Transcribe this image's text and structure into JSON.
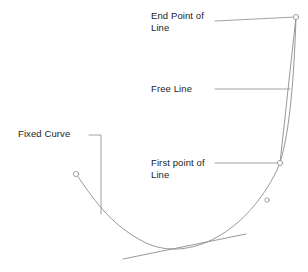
{
  "diagram": {
    "background_color": "#ffffff",
    "stroke_color": "#8c8c8c",
    "text_color": "#1d1d1d",
    "labels": {
      "end_point": "End Point of\nLine",
      "free_line": "Free Line",
      "first_point": "First point of\nLine",
      "fixed_curve": "Fixed Curve"
    },
    "geometry": {
      "fixed_curve": "M 76 174 C 92 196 108 224 146 243 C 190 263 247 232 277 170 C 289 144 294 80 296 17",
      "free_line": "M 280 163 L 296 17",
      "tangent_line": "M 123 259 L 246 234",
      "leader_end_point": "M 215 21 L 296 17",
      "leader_free_line": "M 215 89 L 290 89",
      "leader_first_point": "M 215 163 L 280 163",
      "leader_fixed_curve": "M 89 135 L 101 135 L 101 214"
    },
    "markers": [
      {
        "name": "curve-start-point",
        "cx": 76,
        "cy": 174,
        "r": 2.6
      },
      {
        "name": "line-first-point",
        "cx": 280,
        "cy": 163,
        "r": 2.6
      },
      {
        "name": "line-end-point",
        "cx": 296,
        "cy": 17,
        "r": 2.6
      },
      {
        "name": "curve-mid-point",
        "cx": 267,
        "cy": 200,
        "r": 2.2
      }
    ]
  }
}
